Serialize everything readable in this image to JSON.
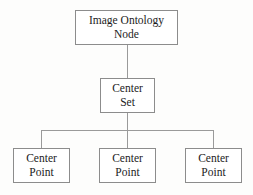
{
  "diagram": {
    "type": "hierarchy-tree",
    "levels": 3,
    "colors": {
      "background": "#fdfdfc",
      "node_fill": "#ffffff",
      "node_border": "#8c8c8c",
      "edge": "#9a9a9a",
      "text": "#1c1c1c"
    },
    "nodes": {
      "root": {
        "label": "Image Ontology\nNode",
        "line1": "Image Ontology",
        "line2": "Node"
      },
      "middle": {
        "label": "Center\nSet",
        "line1": "Center",
        "line2": "Set"
      },
      "leaves": [
        {
          "label": "Center\nPoint",
          "line1": "Center",
          "line2": "Point"
        },
        {
          "label": "Center\nPoint",
          "line1": "Center",
          "line2": "Point"
        },
        {
          "label": "Center\nPoint",
          "line1": "Center",
          "line2": "Point"
        }
      ]
    },
    "edges": [
      {
        "from": "root",
        "to": "middle"
      },
      {
        "from": "middle",
        "to": "leaf-0"
      },
      {
        "from": "middle",
        "to": "leaf-1"
      },
      {
        "from": "middle",
        "to": "leaf-2"
      }
    ]
  }
}
